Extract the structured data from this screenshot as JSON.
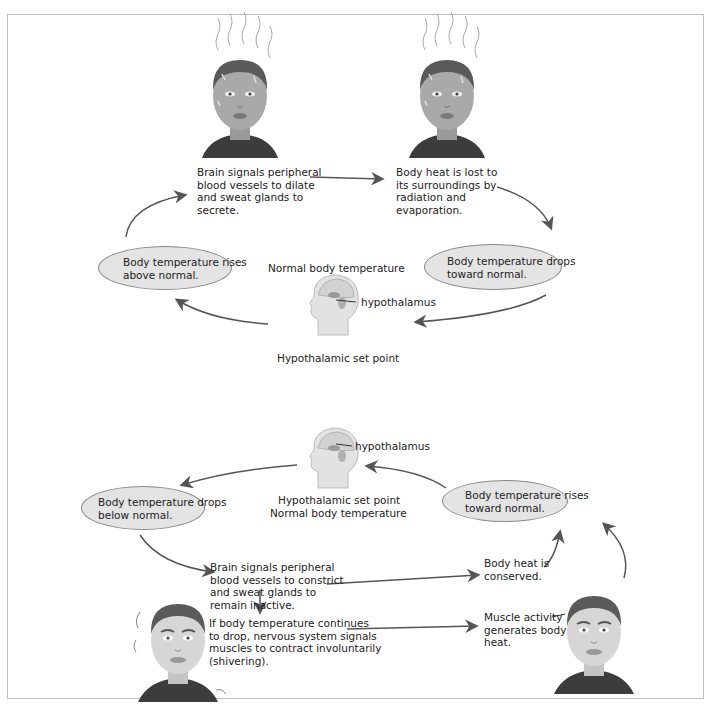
{
  "top_cycle": {
    "brain_signal": [
      "Brain signals peripheral",
      "blood vessels to dilate",
      "and sweat glands to",
      "secrete."
    ],
    "heat_lost": [
      "Body heat is lost to",
      "its surroundings by",
      "radiation and",
      "evaporation."
    ],
    "rises_oval": [
      "Body temperature rises",
      "above normal."
    ],
    "drops_oval": [
      "Body temperature drops",
      "toward normal."
    ],
    "normal_label": "Normal body temperature",
    "hypothalamus_label": "hypothalamus",
    "set_point_label": "Hypothalamic set point"
  },
  "bottom_cycle": {
    "hypothalamus_label": "hypothalamus",
    "set_point_label": "Hypothalamic set point",
    "normal_label": "Normal body temperature",
    "drops_oval": [
      "Body temperature drops",
      "below normal."
    ],
    "rises_oval": [
      "Body temperature rises",
      "toward normal."
    ],
    "brain_signal": [
      "Brain signals peripheral",
      "blood vessels to constrict",
      "and sweat glands to",
      "remain inactive."
    ],
    "shivering": [
      "If body temperature continues",
      "to drop, nervous system signals",
      "muscles to contract involuntarily",
      "(shivering)."
    ],
    "conserved": [
      "Body heat is",
      "conserved."
    ],
    "muscle": [
      "Muscle activity",
      "generates body",
      "heat."
    ]
  },
  "colors": {
    "arrow": "#555555",
    "oval_fill": "#e4e4e4",
    "skin": "#a9a9a9",
    "skin_light": "#cfcfcf",
    "shirt": "#3c3c3c",
    "hair": "#5a5a5a"
  }
}
